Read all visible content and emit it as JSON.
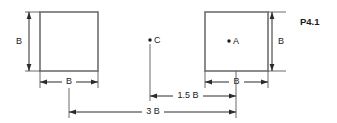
{
  "figure": {
    "plate_label": "P4.1",
    "squares": [
      {
        "id": "left-square",
        "side_label": "B",
        "width_label": "B",
        "height_label": "B"
      },
      {
        "id": "right-square",
        "side_label": "B",
        "width_label": "B",
        "height_label": "B",
        "center_point_label": "A"
      }
    ],
    "points": [
      {
        "name": "point-c",
        "label": "C"
      },
      {
        "name": "point-a",
        "label": "A"
      }
    ],
    "dimensions": [
      {
        "name": "left-square-height",
        "label": "B",
        "orientation": "vertical"
      },
      {
        "name": "left-square-width",
        "label": "B",
        "orientation": "horizontal"
      },
      {
        "name": "right-square-height",
        "label": "B",
        "orientation": "vertical"
      },
      {
        "name": "right-square-width",
        "label": "B",
        "orientation": "horizontal"
      },
      {
        "name": "c-to-a-distance",
        "label": "1.5 B",
        "orientation": "horizontal"
      },
      {
        "name": "left-to-right-distance",
        "label": "3 B",
        "orientation": "horizontal"
      }
    ]
  }
}
